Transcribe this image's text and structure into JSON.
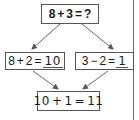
{
  "diagram": {
    "colors": {
      "border": "#555555",
      "arrow": "#555555",
      "text": "#1a1a1a",
      "background": "#ffffff",
      "right_rule": "#6b6b6b"
    },
    "top_box": {
      "left_operand": "8",
      "operator": "+",
      "right_operand": "3",
      "equals": "=",
      "result": "?"
    },
    "left_box": {
      "left_operand": "8",
      "operator": "+",
      "right_operand": "2",
      "equals": "=",
      "answer": "10"
    },
    "right_box": {
      "left_operand": "3",
      "operator": "−",
      "right_operand": "2",
      "equals": "=",
      "answer": "1"
    },
    "bottom_box": {
      "left_operand": "10",
      "operator": "+",
      "right_operand": "1",
      "equals": "=",
      "answer": "11"
    },
    "arrows": [
      {
        "from": "top_box",
        "to": "left_box",
        "icon": "arrow-down-left"
      },
      {
        "from": "top_box",
        "to": "right_box",
        "icon": "arrow-down-right"
      },
      {
        "from": "left_box",
        "to": "bottom_box",
        "icon": "arrow-down-right"
      },
      {
        "from": "right_box",
        "to": "bottom_box",
        "icon": "arrow-down-left"
      }
    ]
  }
}
